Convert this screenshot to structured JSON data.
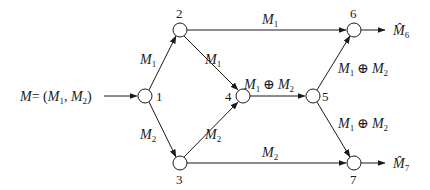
{
  "diagram": {
    "title": "",
    "input_label": "M = (M1, M2)",
    "input": {
      "main": "M",
      "eq": "= (",
      "m1": "M",
      "m1_sub": "1",
      "comma": ", ",
      "m2": "M",
      "m2_sub": "2",
      "close": ")"
    },
    "nodes": [
      {
        "id": "1",
        "label": "1",
        "x": 145,
        "y": 96
      },
      {
        "id": "2",
        "label": "2",
        "x": 180,
        "y": 30
      },
      {
        "id": "3",
        "label": "3",
        "x": 180,
        "y": 163
      },
      {
        "id": "4",
        "label": "4",
        "x": 243,
        "y": 96
      },
      {
        "id": "5",
        "label": "5",
        "x": 313,
        "y": 96
      },
      {
        "id": "6",
        "label": "6",
        "x": 354,
        "y": 30
      },
      {
        "id": "7",
        "label": "7",
        "x": 354,
        "y": 163
      }
    ],
    "edges": [
      {
        "from": "1",
        "to": "2",
        "label": "M1"
      },
      {
        "from": "1",
        "to": "3",
        "label": "M2"
      },
      {
        "from": "2",
        "to": "4",
        "label": "M1"
      },
      {
        "from": "3",
        "to": "4",
        "label": "M2"
      },
      {
        "from": "2",
        "to": "6",
        "label": "M1"
      },
      {
        "from": "3",
        "to": "7",
        "label": "M2"
      },
      {
        "from": "4",
        "to": "5",
        "label": "M1 ⊕ M2"
      },
      {
        "from": "5",
        "to": "6",
        "label": "M1 ⊕ M2"
      },
      {
        "from": "5",
        "to": "7",
        "label": "M1 ⊕ M2"
      }
    ],
    "outputs": [
      {
        "node": "6",
        "label": "M̂6",
        "main": "M̂",
        "sub": "6"
      },
      {
        "node": "7",
        "label": "M̂7",
        "main": "M̂",
        "sub": "7"
      }
    ],
    "text": {
      "M": "M",
      "oplus": "⊕",
      "sub1": "1",
      "sub2": "2",
      "n1": "1",
      "n2": "2",
      "n3": "3",
      "n4": "4",
      "n5": "5",
      "n6": "6",
      "n7": "7",
      "hatM": "M̂",
      "sub6": "6",
      "sub7": "7"
    }
  }
}
